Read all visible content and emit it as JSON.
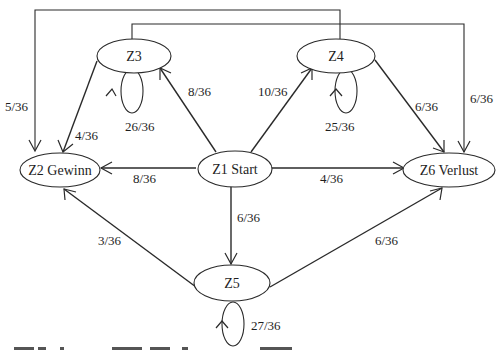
{
  "diagram": {
    "type": "state-transition-graph",
    "nodes": [
      {
        "id": "Z1",
        "label": "Z1 Start"
      },
      {
        "id": "Z2",
        "label": "Z2 Gewinn"
      },
      {
        "id": "Z3",
        "label": "Z3"
      },
      {
        "id": "Z4",
        "label": "Z4"
      },
      {
        "id": "Z5",
        "label": "Z5"
      },
      {
        "id": "Z6",
        "label": "Z6 Verlust"
      }
    ],
    "edges": [
      {
        "from": "Z1",
        "to": "Z2",
        "label": "8/36"
      },
      {
        "from": "Z1",
        "to": "Z3",
        "label": "8/36"
      },
      {
        "from": "Z1",
        "to": "Z4",
        "label": "10/36"
      },
      {
        "from": "Z1",
        "to": "Z6",
        "label": "4/36"
      },
      {
        "from": "Z1",
        "to": "Z5",
        "label": "6/36"
      },
      {
        "from": "Z3",
        "to": "Z2",
        "label": "4/36"
      },
      {
        "from": "Z3",
        "to": "Z3",
        "label": "26/36"
      },
      {
        "from": "Z3",
        "to": "Z6",
        "label": "6/36"
      },
      {
        "from": "Z4",
        "to": "Z2",
        "label": "5/36"
      },
      {
        "from": "Z4",
        "to": "Z4",
        "label": "25/36"
      },
      {
        "from": "Z4",
        "to": "Z6",
        "label": "6/36"
      },
      {
        "from": "Z5",
        "to": "Z2",
        "label": "3/36"
      },
      {
        "from": "Z5",
        "to": "Z6",
        "label": "6/36"
      },
      {
        "from": "Z5",
        "to": "Z5",
        "label": "27/36"
      }
    ],
    "caption_partial": "(cut-off caption text line at bottom edge)"
  }
}
